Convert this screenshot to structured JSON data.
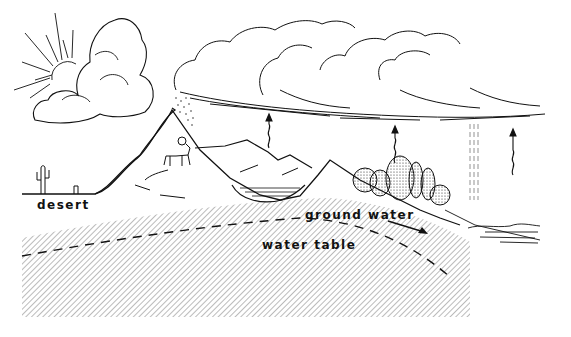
{
  "diagram": {
    "type": "water-cycle-illustration",
    "labels": {
      "desert": "desert",
      "ground_water": "ground water",
      "water_table": "water table"
    },
    "elements": [
      "sun",
      "cumulus-cloud",
      "stratus-clouds",
      "snow",
      "mountain",
      "bighorn-sheep",
      "lake",
      "forest",
      "evaporation-arrows",
      "rain",
      "ocean",
      "cactus",
      "aquifer-hatching",
      "water-table-dashed-line",
      "groundwater-flow-arrow"
    ],
    "colors": {
      "ink": "#111111",
      "background": "#ffffff"
    }
  }
}
